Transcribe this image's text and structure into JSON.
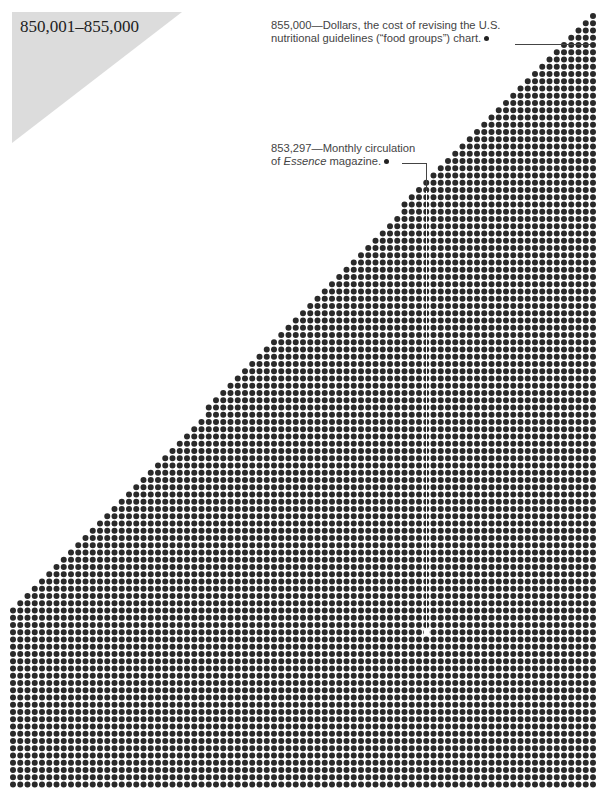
{
  "range_label": "850,001–855,000",
  "annotations": [
    {
      "value": "855,000",
      "line1": "855,000—Dollars, the cost of revising the U.S.",
      "line2": "nutritional guidelines (“food groups”) chart."
    },
    {
      "value": "853,297",
      "line1": "853,297—Monthly circulation",
      "line2_pre": "of ",
      "line2_em": "Essence",
      "line2_post": " magazine."
    }
  ],
  "colors": {
    "dot": "#2a2a2a",
    "triangle": "#dcdcdc",
    "text": "#444444"
  },
  "chart_data": {
    "type": "dot-grid",
    "title": "850,001–855,000",
    "range_start": 850001,
    "range_end": 855000,
    "total_dots": 5000,
    "grid": {
      "columns": 81,
      "triangle_rows": 84,
      "full_rows": 23,
      "pitch_px": 7.25,
      "origin_x": 13,
      "origin_y": 16,
      "dot_diameter_px": 6
    },
    "annotations": [
      {
        "value": 855000,
        "label": "Dollars, the cost of revising the U.S. nutritional guidelines (“food groups”) chart."
      },
      {
        "value": 853297,
        "label": "Monthly circulation of Essence magazine."
      }
    ],
    "grid_lines": false,
    "legend": "none"
  }
}
